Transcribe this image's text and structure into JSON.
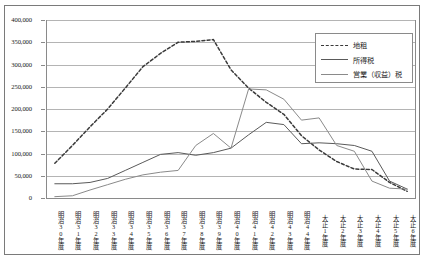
{
  "chart_data": {
    "type": "line",
    "title": "",
    "xlabel": "",
    "ylabel": "",
    "ylim": [
      0,
      400000
    ],
    "ytick_labels": [
      "400,000",
      "350,000",
      "300,000",
      "250,000",
      "200,000",
      "150,000",
      "100,000",
      "50,000",
      "0"
    ],
    "ytick_values": [
      400000,
      350000,
      300000,
      250000,
      200000,
      150000,
      100000,
      50000,
      0
    ],
    "grid": true,
    "legend_position": "top-right",
    "categories": [
      "明治30年度",
      "明治31年度",
      "明治32年度",
      "明治33年度",
      "明治34年度",
      "明治35年度",
      "明治36年度",
      "明治37年度",
      "明治38年度",
      "明治39年度",
      "明治40年度",
      "明治41年度",
      "明治42年度",
      "明治43年度",
      "明治44年度",
      "大正1年度",
      "大正2年度",
      "大正3年度",
      "大正4年度",
      "大正5年度",
      "大正6年度"
    ],
    "series": [
      {
        "name": "地租",
        "style": "dashed",
        "color": "#3a3a3a",
        "values": [
          78000,
          118000,
          160000,
          200000,
          247000,
          295000,
          325000,
          350000,
          352000,
          356000,
          288000,
          247000,
          215000,
          188000,
          140000,
          108000,
          82000,
          65000,
          64000,
          35000,
          15000
        ]
      },
      {
        "name": "所得税",
        "style": "solid",
        "color": "#5a5a5a",
        "values": [
          32000,
          32000,
          35000,
          44000,
          62000,
          80000,
          98000,
          102000,
          96000,
          102000,
          112000,
          142000,
          170000,
          165000,
          122000,
          124000,
          122000,
          118000,
          105000,
          38000,
          20000
        ]
      },
      {
        "name": "営業（収益）税",
        "style": "solid",
        "color": "#8a8a8a",
        "values": [
          3000,
          5000,
          18000,
          30000,
          42000,
          52000,
          58000,
          62000,
          118000,
          145000,
          112000,
          245000,
          243000,
          222000,
          175000,
          180000,
          118000,
          105000,
          38000,
          22000,
          20000
        ]
      }
    ]
  }
}
